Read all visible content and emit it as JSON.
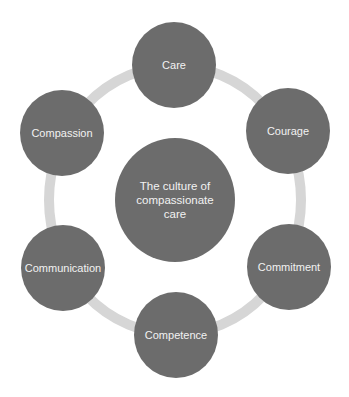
{
  "diagram": {
    "type": "cycle",
    "colors": {
      "node_fill": "#6c6c6c",
      "ring": "#d6d6d6",
      "text": "#f2f2f2",
      "background": "#ffffff"
    },
    "center": {
      "label": "The culture of compassionate care",
      "lines": [
        "The culture of",
        "compassionate",
        "care"
      ]
    },
    "nodes": [
      {
        "id": "care",
        "label": "Care"
      },
      {
        "id": "courage",
        "label": "Courage"
      },
      {
        "id": "commitment",
        "label": "Commitment"
      },
      {
        "id": "competence",
        "label": "Competence"
      },
      {
        "id": "communication",
        "label": "Communication"
      },
      {
        "id": "compassion",
        "label": "Compassion"
      }
    ]
  }
}
